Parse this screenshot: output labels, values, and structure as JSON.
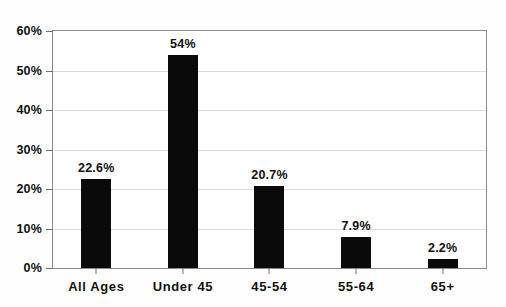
{
  "chart_data": {
    "type": "bar",
    "title": "",
    "xlabel": "",
    "ylabel": "",
    "categories": [
      "All Ages",
      "Under 45",
      "45-54",
      "55-64",
      "65+"
    ],
    "values": [
      22.6,
      54,
      20.7,
      7.9,
      2.2
    ],
    "value_labels": [
      "22.6%",
      "54%",
      "20.7%",
      "7.9%",
      "2.2%"
    ],
    "ylim": [
      0,
      60
    ],
    "ytick_values": [
      0,
      10,
      20,
      30,
      40,
      50,
      60
    ],
    "ytick_labels": [
      "0%",
      "10%",
      "20%",
      "30%",
      "40%",
      "50%",
      "60%"
    ],
    "grid": true,
    "legend": "none",
    "bar_color": "#0a0a0a",
    "grid_color": "#dcdcdc",
    "axis_color": "#8a8a8a",
    "background_color": "#ffffff"
  }
}
